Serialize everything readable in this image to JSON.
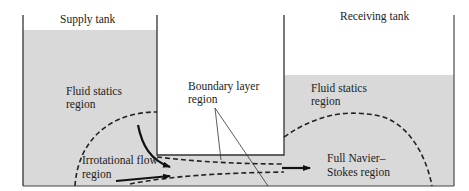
{
  "diagram": {
    "colors": {
      "fluid": "#d9d9d9",
      "air": "#ffffff",
      "wall": "#333333",
      "dashed_boundary": "#222222",
      "arrow": "#111111"
    },
    "labels": {
      "supply_tank": "Supply tank",
      "receiving_tank": "Receiving tank",
      "fluid_statics_left_line1": "Fluid statics",
      "fluid_statics_left_line2": "region",
      "boundary_layer_line1": "Boundary layer",
      "boundary_layer_line2": "region",
      "fluid_statics_right_line1": "Fluid statics",
      "fluid_statics_right_line2": "region",
      "irrotational_line1": "Irrotational flow",
      "irrotational_line2": "region",
      "navier_stokes_line1": "Full Navier–",
      "navier_stokes_line2": "Stokes region"
    }
  }
}
